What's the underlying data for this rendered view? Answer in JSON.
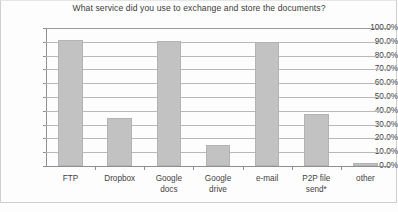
{
  "chart_data": {
    "type": "bar",
    "title": "What service did you use to exchange and store the documents?",
    "xlabel": "",
    "ylabel": "",
    "categories": [
      "FTP",
      "Dropbox",
      "Google docs",
      "Google drive",
      "e-mail",
      "P2P file send*",
      "other"
    ],
    "values": [
      91.0,
      35.0,
      90.5,
      15.0,
      90.0,
      38.0,
      2.0
    ],
    "ylim": [
      0,
      100
    ],
    "ytick_labels": [
      "100.0%",
      "90.0%",
      "80.0%",
      "70.0%",
      "60.0%",
      "50.0%",
      "40.0%",
      "30.0%",
      "20.0%",
      "10.0%",
      "0.0%"
    ],
    "ytick_values": [
      100,
      90,
      80,
      70,
      60,
      50,
      40,
      30,
      20,
      10,
      0
    ],
    "grid": true,
    "legend": false,
    "bar_color": "#c2c2c2",
    "axis_color": "#8f8f8f",
    "grid_color": "#b8b8b8",
    "text_color": "#3f3f3f"
  }
}
